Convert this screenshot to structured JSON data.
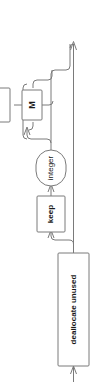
{
  "diagram": {
    "orientation": "rotated-90-ccw",
    "stroke_color": "#7a7a7a",
    "text_color": "#1a1a1a",
    "background_color": "#ffffff",
    "nodes": [
      {
        "id": "m",
        "label": "M",
        "shape": "rect",
        "icon": "box-node-icon"
      },
      {
        "id": "integer",
        "label": "integer",
        "shape": "stadium",
        "icon": "oval-node-icon"
      },
      {
        "id": "keep",
        "label": "keep",
        "shape": "rect",
        "icon": "box-node-icon"
      },
      {
        "id": "dealloc",
        "label": "deallocate unused",
        "shape": "rect",
        "icon": "box-node-icon"
      }
    ],
    "arrows": [
      {
        "id": "entry-arrow",
        "label": "entry-arrow-icon",
        "direction": "up"
      },
      {
        "id": "exit-arrow",
        "label": "exit-arrow-icon",
        "direction": "up"
      },
      {
        "id": "loop-arrow",
        "label": "loop-arrow-icon",
        "direction": "up"
      },
      {
        "id": "keep-arrow",
        "label": "keep-arrow-icon",
        "direction": "up"
      },
      {
        "id": "int-arrow",
        "label": "integer-arrow-icon",
        "direction": "up"
      }
    ]
  }
}
